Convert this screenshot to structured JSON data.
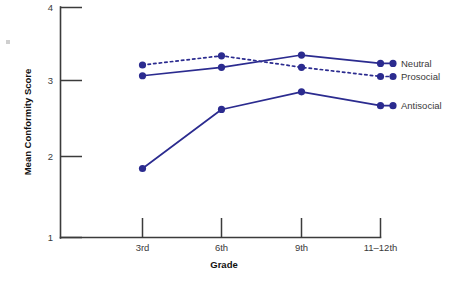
{
  "chart_data": {
    "type": "line",
    "title": "",
    "xlabel": "Grade",
    "ylabel": "Mean Conformity Score",
    "categories": [
      "3rd",
      "6th",
      "9th",
      "11–12th"
    ],
    "ylim": [
      1,
      4
    ],
    "yticks": [
      1,
      2,
      3,
      4
    ],
    "ytick_labels": [
      "1",
      "2",
      "3",
      "4"
    ],
    "grid": false,
    "legend_position": "right-inline",
    "series": [
      {
        "name": "Neutral",
        "style": "solid",
        "color": "#2b2b8f",
        "values": [
          3.11,
          3.22,
          3.38,
          3.27
        ]
      },
      {
        "name": "Prosocial",
        "style": "dotted",
        "color": "#2b2b8f",
        "values": [
          3.25,
          3.37,
          3.22,
          3.1
        ]
      },
      {
        "name": "Antisocial",
        "style": "solid",
        "color": "#2b2b8f",
        "values": [
          1.9,
          2.67,
          2.9,
          2.72
        ]
      }
    ]
  },
  "axes": {
    "y_tick_1": "1",
    "y_tick_2": "2",
    "y_tick_3": "3",
    "y_tick_4": "4",
    "x_tick_0": "3rd",
    "x_tick_1": "6th",
    "x_tick_2": "9th",
    "x_tick_3": "11–12th",
    "x_axis_title": "Grade",
    "y_axis_title": "Mean Conformity Score"
  },
  "legend": {
    "neutral": "Neutral",
    "prosocial": "Prosocial",
    "antisocial": "Antisocial"
  },
  "colors": {
    "series": "#2b2b8f",
    "axis": "#3b3b3b",
    "tick_text": "#3a3a3a",
    "title_text": "#111111",
    "background": "#ffffff"
  }
}
